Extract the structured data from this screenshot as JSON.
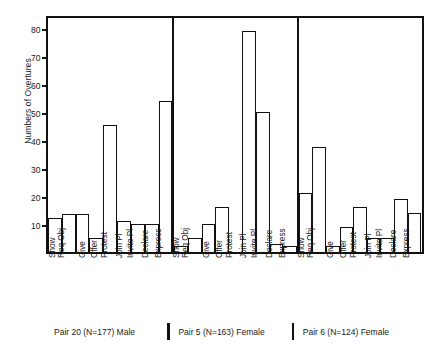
{
  "chart_data": {
    "type": "bar",
    "title": "",
    "subtitle": "",
    "xlabel": "",
    "ylabel": "Numbers of Overtures",
    "ylim": [
      0,
      85
    ],
    "yticks": [
      10,
      20,
      30,
      40,
      50,
      60,
      70,
      80
    ],
    "grid": false,
    "legend": null,
    "categories": [
      "Show",
      "Req Obj",
      "Give",
      "Offer",
      "Protest",
      "Join Pl",
      "Invite Pl",
      "Declare",
      "Express"
    ],
    "panels": [
      {
        "name": "Pair 20 (N=177) Male",
        "pair": "Pair 20",
        "n": 177,
        "sex": "Male",
        "values": [
          12,
          13.5,
          13.5,
          5,
          45.5,
          11,
          10,
          10,
          54
        ]
      },
      {
        "name": "Pair 5 (N=163) Female",
        "pair": "Pair 5",
        "n": 163,
        "sex": "Female",
        "values": [
          2,
          5,
          10,
          16,
          0,
          79,
          50,
          3,
          2
        ]
      },
      {
        "name": "Pair 6 (N=124) Female",
        "pair": "Pair 6",
        "n": 124,
        "sex": "Female",
        "values": [
          21,
          37.5,
          2,
          9,
          16,
          5,
          5,
          19,
          14
        ]
      }
    ]
  },
  "axis": {
    "y_title": "Numbers of Overtures",
    "y_tick_labels": [
      "80",
      "70",
      "60",
      "50",
      "40",
      "30",
      "20",
      "10"
    ]
  },
  "captions": [
    {
      "text": "Pair  20  (N=177) Male"
    },
    {
      "text": "Pair  5  (N=163) Female"
    },
    {
      "text": "Pair  6  (N=124) Female"
    }
  ],
  "colors": {
    "ink": "#111111",
    "bar_fill": "#ffffff",
    "background": "#ffffff"
  }
}
